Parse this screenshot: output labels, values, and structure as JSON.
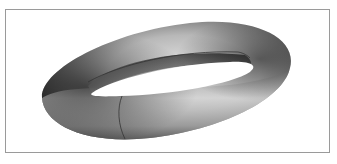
{
  "figure": {
    "colors": {
      "background": "#ffffff",
      "frame": "#9a9a9a",
      "shade_dark": "#1a1a1a",
      "shade_mid": "#6e6e6e",
      "shade_light": "#e6e6e6",
      "seam_line": "#333333"
    }
  }
}
